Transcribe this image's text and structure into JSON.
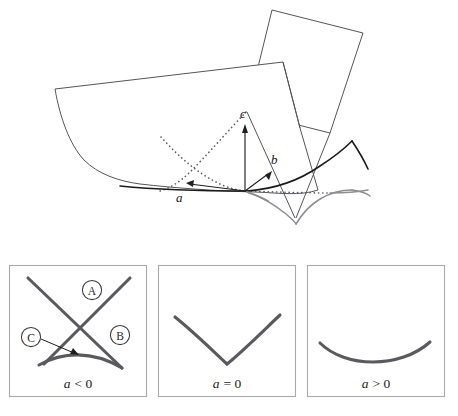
{
  "figure": {
    "background_color": "#ffffff",
    "stroke_color": "#55555a",
    "accent_curve_color": "#5a5a5e",
    "panel_border_color": "#a9a9ad"
  },
  "diagram3d": {
    "name": "swallowtail-surface",
    "axes": [
      {
        "id": "a",
        "label": "a",
        "direction": "left-foreground"
      },
      {
        "id": "b",
        "label": "b",
        "direction": "right-foreground"
      },
      {
        "id": "c",
        "label": "c",
        "direction": "up"
      }
    ],
    "features": [
      {
        "id": "upper-sheet",
        "kind": "planar-sheet"
      },
      {
        "id": "lower-sheet",
        "kind": "curved-sheet"
      },
      {
        "id": "cusp-lines",
        "kind": "dotted-curve",
        "style": "dotted"
      },
      {
        "id": "swallowtail-tail",
        "kind": "self-intersection-curve"
      }
    ]
  },
  "sections": {
    "name": "cross-sections",
    "panels": [
      {
        "id": "panel-a-negative",
        "caption_symbol": "a",
        "caption_relation": "< 0",
        "caption": "a < 0",
        "shape": "two crossing lines with curvilinear triangle",
        "region_labels": [
          {
            "id": "A",
            "text": "A",
            "position": "upper-middle"
          },
          {
            "id": "B",
            "text": "B",
            "position": "right-middle"
          },
          {
            "id": "C",
            "text": "C",
            "position": "left-middle",
            "has_leader_arrow": true
          }
        ]
      },
      {
        "id": "panel-a-zero",
        "caption_symbol": "a",
        "caption_relation": "= 0",
        "caption": "a = 0",
        "shape": "V-shaped cusp curve",
        "region_labels": []
      },
      {
        "id": "panel-a-positive",
        "caption_symbol": "a",
        "caption_relation": "> 0",
        "caption": "a > 0",
        "shape": "smooth U-shaped curve",
        "region_labels": []
      }
    ]
  }
}
